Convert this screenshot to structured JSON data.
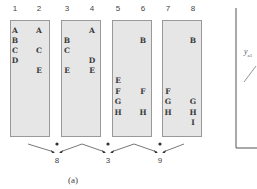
{
  "diagram": {
    "columns": [
      {
        "label": "1",
        "x": 15,
        "letters": [
          {
            "text": "A",
            "row": 0
          },
          {
            "text": "B",
            "row": 1
          },
          {
            "text": "C",
            "row": 2
          },
          {
            "text": "D",
            "row": 3
          }
        ]
      },
      {
        "label": "2",
        "x": 39,
        "letters": [
          {
            "text": "A",
            "row": 0
          },
          {
            "text": "C",
            "row": 2
          },
          {
            "text": "E",
            "row": 4
          }
        ]
      },
      {
        "label": "3",
        "x": 67,
        "letters": [
          {
            "text": "B",
            "row": 1
          },
          {
            "text": "C",
            "row": 2
          },
          {
            "text": "E",
            "row": 4
          }
        ]
      },
      {
        "label": "4",
        "x": 92,
        "letters": [
          {
            "text": "A",
            "row": 0
          },
          {
            "text": "D",
            "row": 3
          },
          {
            "text": "E",
            "row": 4
          }
        ]
      },
      {
        "label": "5",
        "x": 118,
        "letters": [
          {
            "text": "E",
            "row": 5
          },
          {
            "text": "F",
            "row": 6
          },
          {
            "text": "G",
            "row": 7
          },
          {
            "text": "H",
            "row": 8
          }
        ]
      },
      {
        "label": "6",
        "x": 143,
        "letters": [
          {
            "text": "B",
            "row": 1
          },
          {
            "text": "F",
            "row": 6
          },
          {
            "text": "H",
            "row": 8
          }
        ]
      },
      {
        "label": "7",
        "x": 168,
        "letters": [
          {
            "text": "F",
            "row": 6
          },
          {
            "text": "G",
            "row": 7
          },
          {
            "text": "H",
            "row": 8
          }
        ]
      },
      {
        "label": "8",
        "x": 193,
        "letters": [
          {
            "text": "B",
            "row": 1
          },
          {
            "text": "G",
            "row": 7
          },
          {
            "text": "H",
            "row": 8
          },
          {
            "text": "I",
            "row": 9
          }
        ]
      }
    ],
    "results": [
      {
        "label": "8",
        "x": 57
      },
      {
        "label": "3",
        "x": 108
      },
      {
        "label": "9",
        "x": 160
      }
    ],
    "caption": "(a)",
    "side_plot": {
      "ylabel_main": "y",
      "ylabel_sub": "a1"
    }
  }
}
